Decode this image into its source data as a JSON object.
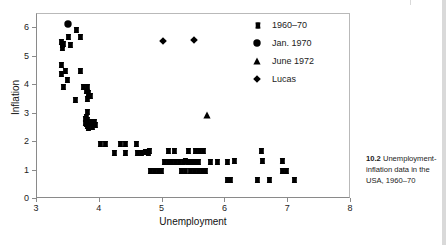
{
  "figure": {
    "caption_number": "10.2",
    "caption_text": "Unemployment-inflation data in the USA, 1960–70"
  },
  "axes": {
    "x_title": "Unemployment",
    "y_title": "Inflation",
    "x_ticks": [
      "3",
      "4",
      "5",
      "6",
      "7",
      "8"
    ],
    "y_ticks": [
      "0",
      "1",
      "2",
      "3",
      "4",
      "5",
      "6"
    ]
  },
  "legend": {
    "items": [
      {
        "label": "1960–70",
        "marker": "cross-marker",
        "color": "#000000"
      },
      {
        "label": "Jan. 1970",
        "marker": "circle-marker",
        "color": "#000000"
      },
      {
        "label": "June 1972",
        "marker": "triangle-marker",
        "color": "#000000"
      },
      {
        "label": "Lucas",
        "marker": "diamond-marker",
        "color": "#000000"
      }
    ]
  },
  "chart_data": {
    "type": "scatter",
    "title": "",
    "xlabel": "Unemployment",
    "ylabel": "Inflation",
    "xlim": [
      3,
      8
    ],
    "ylim": [
      0,
      6.5
    ],
    "grid": false,
    "legend_position": "top-right",
    "series": [
      {
        "name": "1960–70",
        "marker": "cross-marker",
        "color": "#000000",
        "points": [
          [
            3.38,
            5.5
          ],
          [
            3.4,
            5.42
          ],
          [
            3.4,
            5.3
          ],
          [
            3.42,
            5.45
          ],
          [
            3.5,
            5.7
          ],
          [
            3.52,
            5.42
          ],
          [
            3.62,
            5.95
          ],
          [
            3.68,
            5.68
          ],
          [
            3.38,
            4.72
          ],
          [
            3.38,
            4.4
          ],
          [
            3.45,
            4.48
          ],
          [
            3.48,
            4.18
          ],
          [
            3.42,
            3.93
          ],
          [
            3.6,
            3.48
          ],
          [
            3.68,
            4.48
          ],
          [
            3.74,
            3.92
          ],
          [
            3.8,
            3.95
          ],
          [
            3.78,
            3.78
          ],
          [
            3.82,
            3.72
          ],
          [
            3.8,
            3.52
          ],
          [
            3.84,
            3.62
          ],
          [
            3.8,
            3.05
          ],
          [
            3.78,
            2.88
          ],
          [
            3.76,
            2.82
          ],
          [
            3.8,
            2.78
          ],
          [
            3.76,
            2.68
          ],
          [
            3.78,
            2.62
          ],
          [
            3.8,
            2.55
          ],
          [
            3.82,
            2.5
          ],
          [
            3.86,
            2.72
          ],
          [
            3.9,
            2.7
          ],
          [
            3.92,
            2.6
          ],
          [
            3.88,
            2.52
          ],
          [
            4.0,
            1.92
          ],
          [
            4.08,
            1.92
          ],
          [
            4.22,
            1.6
          ],
          [
            4.32,
            1.92
          ],
          [
            4.4,
            1.92
          ],
          [
            4.4,
            1.6
          ],
          [
            4.58,
            1.92
          ],
          [
            4.6,
            1.62
          ],
          [
            4.66,
            1.62
          ],
          [
            4.72,
            1.65
          ],
          [
            4.76,
            1.62
          ],
          [
            4.78,
            1.7
          ],
          [
            4.8,
            1.0
          ],
          [
            4.86,
            1.0
          ],
          [
            4.92,
            1.0
          ],
          [
            4.98,
            1.0
          ],
          [
            5.02,
            1.3
          ],
          [
            5.08,
            1.3
          ],
          [
            5.14,
            1.3
          ],
          [
            5.2,
            1.3
          ],
          [
            5.08,
            1.7
          ],
          [
            5.18,
            1.7
          ],
          [
            5.26,
            1.3
          ],
          [
            5.32,
            1.3
          ],
          [
            5.36,
            1.32
          ],
          [
            5.4,
            1.3
          ],
          [
            5.44,
            1.3
          ],
          [
            5.48,
            1.3
          ],
          [
            5.52,
            1.3
          ],
          [
            5.56,
            1.3
          ],
          [
            5.4,
            1.7
          ],
          [
            5.52,
            1.7
          ],
          [
            5.58,
            1.68
          ],
          [
            5.64,
            1.68
          ],
          [
            5.3,
            1.0
          ],
          [
            5.36,
            1.0
          ],
          [
            5.44,
            1.0
          ],
          [
            5.5,
            1.0
          ],
          [
            5.56,
            1.0
          ],
          [
            5.62,
            1.0
          ],
          [
            5.68,
            1.0
          ],
          [
            5.76,
            1.3
          ],
          [
            5.86,
            1.3
          ],
          [
            6.02,
            0.68
          ],
          [
            6.08,
            0.68
          ],
          [
            6.02,
            1.3
          ],
          [
            6.14,
            1.32
          ],
          [
            6.5,
            0.68
          ],
          [
            6.56,
            1.7
          ],
          [
            6.58,
            1.32
          ],
          [
            6.7,
            0.68
          ],
          [
            6.9,
            1.32
          ],
          [
            6.9,
            1.0
          ],
          [
            6.96,
            1.0
          ],
          [
            7.1,
            0.68
          ]
        ]
      },
      {
        "name": "Jan. 1970",
        "marker": "circle-marker",
        "color": "#000000",
        "points": [
          [
            3.5,
            6.15
          ]
        ]
      },
      {
        "name": "June 1972",
        "marker": "triangle-marker",
        "color": "#000000",
        "points": [
          [
            5.7,
            2.95
          ]
        ]
      },
      {
        "name": "Lucas",
        "marker": "diamond-marker",
        "color": "#000000",
        "points": [
          [
            5.0,
            5.55
          ],
          [
            5.5,
            5.6
          ]
        ]
      }
    ]
  }
}
